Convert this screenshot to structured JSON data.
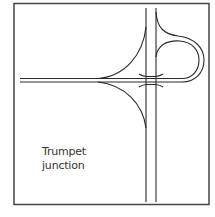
{
  "diagram": {
    "title_line1": "Trumpet",
    "title_line2": "junction",
    "type": "road interchange schematic",
    "colors": {
      "stroke": "#2a2a2a",
      "frame": "#444444",
      "background": "#ffffff",
      "text": "#333333"
    }
  }
}
